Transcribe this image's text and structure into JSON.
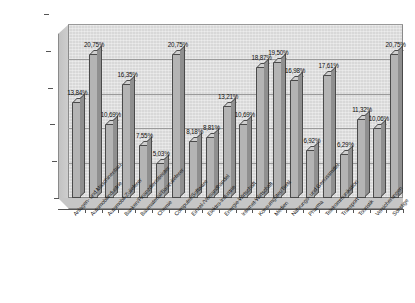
{
  "chart_data": {
    "type": "bar",
    "title": "",
    "subtitle": "",
    "xlabel": "",
    "ylabel": "",
    "ylim": [
      0,
      25
    ],
    "grid": true,
    "legend": false,
    "legend_position": "none",
    "value_format": "german-percent-2dp",
    "axis_ticks": [
      "0,00%",
      "5,00%",
      "10,00%",
      "15,00%",
      "20,00%",
      "25,00%"
    ],
    "axis_tick_values": [
      0,
      5,
      10,
      15,
      20,
      25
    ],
    "categories": [
      "Anlagen- und Maschinenbau",
      "Automobilindustrie",
      "Automobil-Zulieferer",
      "Banken/Finanzdienstleister",
      "Baumaterial/Bauzulieferer",
      "Chemie",
      "Computer/Software",
      "Einzel-/Versandhandel",
      "Elektro-Industrie",
      "Energie-Wirtschaft",
      "Internet-Wirtschaft",
      "Konsumgüter/Textil",
      "Medien",
      "Nahrungs- und Genussmittel",
      "Pharma",
      "Telekommunikation",
      "Transport",
      "Touristik",
      "Versicherungen",
      "Sonstige"
    ],
    "values": [
      13.84,
      20.75,
      10.69,
      16.35,
      7.55,
      5.03,
      20.75,
      8.18,
      8.81,
      13.21,
      10.69,
      18.87,
      19.5,
      16.98,
      6.92,
      17.61,
      6.29,
      11.32,
      10.06,
      20.75
    ],
    "value_labels": [
      "13,84%",
      "20,75%",
      "10,69%",
      "16,35%",
      "7,55%",
      "5,03%",
      "20,75%",
      "8,18%",
      "8,81%",
      "13,21%",
      "10,69%",
      "18,87%",
      "19,50%",
      "16,98%",
      "6,92%",
      "17,61%",
      "6,29%",
      "11,32%",
      "10,06%",
      "20,75%"
    ],
    "colors": {
      "bar_front": "#b4b4b4",
      "bar_top": "#cfcfcf",
      "bar_side": "#8f8f8f",
      "bar_outline": "#4a4a4a",
      "plot_background": "#d8d8d8",
      "gridline": "#9a9a9a",
      "page_background": "#ffffff",
      "text": "#1a1a1a"
    }
  }
}
